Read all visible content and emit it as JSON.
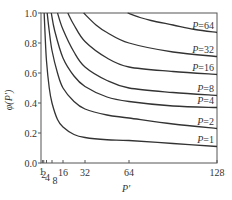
{
  "chart_data": {
    "type": "line",
    "title": "",
    "xlabel": "P'",
    "ylabel": "φ(P')",
    "xlim": [
      0,
      128
    ],
    "ylim": [
      0.0,
      1.0
    ],
    "grid": false,
    "x_ticks": [
      {
        "value": 1,
        "label": "1"
      },
      {
        "value": 2,
        "label": "2"
      },
      {
        "value": 4,
        "label": "4"
      },
      {
        "value": 8,
        "label": "8"
      },
      {
        "value": 16,
        "label": "16"
      },
      {
        "value": 32,
        "label": "32"
      },
      {
        "value": 64,
        "label": "64"
      },
      {
        "value": 128,
        "label": "128"
      }
    ],
    "y_ticks": [
      {
        "value": 0.0,
        "label": "0.0"
      },
      {
        "value": 0.2,
        "label": "0.2"
      },
      {
        "value": 0.4,
        "label": "0.4"
      },
      {
        "value": 0.6,
        "label": "0.6"
      },
      {
        "value": 0.8,
        "label": "0.8"
      },
      {
        "value": 1.0,
        "label": "1.0"
      }
    ],
    "series": [
      {
        "name": "P=64",
        "label": "P=64",
        "x": [
          63,
          72,
          80,
          96,
          112,
          128
        ],
        "y": [
          1.0,
          0.97,
          0.95,
          0.92,
          0.89,
          0.87
        ]
      },
      {
        "name": "P=32",
        "label": "P=32",
        "x": [
          31,
          40,
          48,
          64,
          96,
          128
        ],
        "y": [
          1.0,
          0.92,
          0.87,
          0.8,
          0.74,
          0.71
        ]
      },
      {
        "name": "P=16",
        "label": "P=16",
        "x": [
          19.5,
          24,
          32,
          48,
          64,
          96,
          128
        ],
        "y": [
          1.0,
          0.92,
          0.81,
          0.7,
          0.64,
          0.61,
          0.59
        ]
      },
      {
        "name": "P=8",
        "label": "P=8",
        "x": [
          12,
          16,
          24,
          32,
          48,
          64,
          96,
          128
        ],
        "y": [
          1.0,
          0.89,
          0.74,
          0.64,
          0.55,
          0.5,
          0.47,
          0.45
        ]
      },
      {
        "name": "P=4",
        "label": "P=4",
        "x": [
          7.5,
          10,
          16,
          24,
          32,
          48,
          64,
          96,
          128
        ],
        "y": [
          1.0,
          0.88,
          0.7,
          0.58,
          0.51,
          0.44,
          0.41,
          0.38,
          0.37
        ]
      },
      {
        "name": "P=2",
        "label": "P=2",
        "x": [
          4.5,
          6,
          8,
          12,
          16,
          24,
          32,
          48,
          64,
          96,
          128
        ],
        "y": [
          1.0,
          0.88,
          0.75,
          0.6,
          0.5,
          0.41,
          0.36,
          0.32,
          0.3,
          0.26,
          0.23
        ]
      },
      {
        "name": "P=1",
        "label": "P=1",
        "x": [
          2.3,
          3,
          4,
          6,
          8,
          12,
          16,
          24,
          32,
          48,
          64,
          96,
          128
        ],
        "y": [
          1.0,
          0.85,
          0.68,
          0.5,
          0.4,
          0.29,
          0.24,
          0.19,
          0.17,
          0.155,
          0.15,
          0.13,
          0.11
        ]
      }
    ]
  }
}
